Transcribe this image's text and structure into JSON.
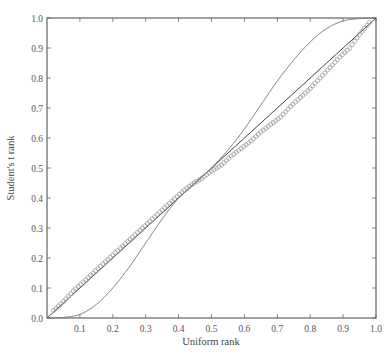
{
  "chart_data": {
    "type": "scatter",
    "title": "",
    "xlabel": "Uniform rank",
    "ylabel": "Student's t rank",
    "xlim": [
      0.0,
      1.0
    ],
    "ylim": [
      0.0,
      1.0
    ],
    "grid": false,
    "legend": null,
    "x_ticks": [
      "0.1",
      "0.2",
      "0.3",
      "0.4",
      "0.5",
      "0.6",
      "0.7",
      "0.8",
      "0.9",
      "1.0"
    ],
    "y_ticks": [
      "0.0",
      "0.1",
      "0.2",
      "0.3",
      "0.4",
      "0.5",
      "0.6",
      "0.7",
      "0.8",
      "0.9",
      "1.0"
    ],
    "origin_label": "0.0",
    "series": [
      {
        "name": "diagonal reference",
        "style": "line",
        "x": [
          0.0,
          1.0
        ],
        "y": [
          0.0,
          1.0
        ]
      },
      {
        "name": "S-shaped rank curve",
        "style": "line",
        "x": [
          0.0,
          0.05,
          0.1,
          0.15,
          0.2,
          0.25,
          0.3,
          0.35,
          0.4,
          0.45,
          0.5,
          0.55,
          0.6,
          0.65,
          0.7,
          0.75,
          0.8,
          0.85,
          0.9,
          0.95,
          1.0
        ],
        "y": [
          0.0,
          0.002,
          0.012,
          0.045,
          0.1,
          0.17,
          0.25,
          0.33,
          0.4,
          0.45,
          0.5,
          0.56,
          0.63,
          0.71,
          0.79,
          0.86,
          0.92,
          0.965,
          0.99,
          0.998,
          1.0
        ]
      },
      {
        "name": "empirical ranks",
        "style": "markers-open-circle",
        "x": [
          0.02,
          0.05,
          0.08,
          0.11,
          0.14,
          0.17,
          0.2,
          0.23,
          0.26,
          0.29,
          0.32,
          0.35,
          0.38,
          0.41,
          0.44,
          0.47,
          0.5,
          0.53,
          0.56,
          0.59,
          0.62,
          0.65,
          0.68,
          0.71,
          0.74,
          0.77,
          0.8,
          0.83,
          0.86,
          0.89,
          0.92,
          0.95,
          0.98
        ],
        "y": [
          0.025,
          0.055,
          0.09,
          0.12,
          0.15,
          0.18,
          0.21,
          0.24,
          0.27,
          0.3,
          0.33,
          0.36,
          0.39,
          0.42,
          0.445,
          0.465,
          0.49,
          0.51,
          0.54,
          0.565,
          0.59,
          0.62,
          0.645,
          0.67,
          0.705,
          0.735,
          0.765,
          0.8,
          0.835,
          0.87,
          0.9,
          0.945,
          0.985
        ]
      }
    ]
  },
  "caption": {
    "visible": "partially cut off at bottom edge"
  }
}
